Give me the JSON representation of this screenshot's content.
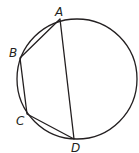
{
  "figure": {
    "circle": {
      "cx": 77,
      "cy": 79,
      "r": 60,
      "stroke": "#231f20"
    },
    "points": {
      "A": {
        "x": 60,
        "y": 19,
        "label": "A",
        "lx": 55,
        "ly": 16
      },
      "B": {
        "x": 20,
        "y": 58,
        "label": "B",
        "lx": 9,
        "ly": 57
      },
      "C": {
        "x": 27,
        "y": 114,
        "label": "C",
        "lx": 16,
        "ly": 125
      },
      "D": {
        "x": 74,
        "y": 139,
        "label": "D",
        "lx": 71,
        "ly": 152
      }
    },
    "segments": [
      [
        "A",
        "B"
      ],
      [
        "B",
        "C"
      ],
      [
        "C",
        "D"
      ],
      [
        "D",
        "A"
      ]
    ]
  }
}
